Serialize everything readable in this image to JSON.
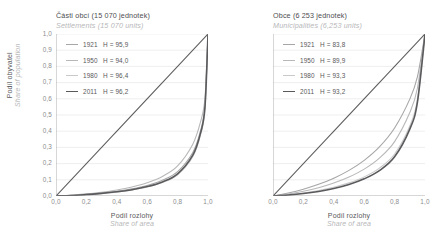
{
  "chart_data": [
    {
      "type": "line",
      "panel": "left",
      "title": "Části obcí (15 070 jednotek)",
      "subtitle": "Settlements (15 070 units)",
      "xlabel": "Podíl rozlohy",
      "xlabel_en": "Share of area",
      "ylabel": "Podíl obyvatel",
      "ylabel_en": "Share of population",
      "xlim": [
        0,
        1
      ],
      "ylim": [
        0,
        1
      ],
      "xticks": [
        "0,0",
        "0,2",
        "0,4",
        "0,6",
        "0,8",
        "1,0"
      ],
      "xtick_values": [
        0,
        0.2,
        0.4,
        0.6,
        0.8,
        1.0
      ],
      "yticks": [
        "0,0",
        "0,1",
        "0,2",
        "0,3",
        "0,4",
        "0,5",
        "0,6",
        "0,7",
        "0,8",
        "0,9",
        "1,0"
      ],
      "ytick_values": [
        0,
        0.1,
        0.2,
        0.3,
        0.4,
        0.5,
        0.6,
        0.7,
        0.8,
        0.9,
        1.0
      ],
      "grid": true,
      "legend_position": "top-left",
      "equality_line": true,
      "series": [
        {
          "name": "1921",
          "h_label": "H = 95,9",
          "h_value": 95.9,
          "color": "#a6a6a8",
          "width": 1.1,
          "x": [
            0,
            0.1,
            0.2,
            0.3,
            0.4,
            0.5,
            0.6,
            0.7,
            0.8,
            0.9,
            0.95,
            0.98,
            1.0
          ],
          "y": [
            0,
            0.004,
            0.01,
            0.018,
            0.029,
            0.044,
            0.065,
            0.097,
            0.15,
            0.268,
            0.4,
            0.56,
            1.0
          ]
        },
        {
          "name": "1950",
          "h_label": "H = 94,0",
          "h_value": 94.0,
          "color": "#b8b8ba",
          "width": 1.1,
          "x": [
            0,
            0.1,
            0.2,
            0.3,
            0.4,
            0.5,
            0.6,
            0.7,
            0.8,
            0.9,
            0.95,
            0.98,
            1.0
          ],
          "y": [
            0,
            0.005,
            0.013,
            0.023,
            0.037,
            0.056,
            0.082,
            0.121,
            0.186,
            0.32,
            0.455,
            0.605,
            1.0
          ]
        },
        {
          "name": "1980",
          "h_label": "H = 96,4",
          "h_value": 96.4,
          "color": "#c9c9cb",
          "width": 1.1,
          "x": [
            0,
            0.1,
            0.2,
            0.3,
            0.4,
            0.5,
            0.6,
            0.7,
            0.8,
            0.9,
            0.95,
            0.98,
            1.0
          ],
          "y": [
            0,
            0.003,
            0.008,
            0.015,
            0.024,
            0.037,
            0.055,
            0.083,
            0.131,
            0.243,
            0.375,
            0.54,
            1.0
          ]
        },
        {
          "name": "2011",
          "h_label": "H = 96,2",
          "h_value": 96.2,
          "color": "#5a5a5c",
          "width": 1.6,
          "x": [
            0,
            0.1,
            0.2,
            0.3,
            0.4,
            0.5,
            0.6,
            0.7,
            0.8,
            0.9,
            0.95,
            0.98,
            1.0
          ],
          "y": [
            0,
            0.003,
            0.009,
            0.016,
            0.026,
            0.039,
            0.058,
            0.087,
            0.137,
            0.252,
            0.385,
            0.548,
            1.0
          ]
        }
      ]
    },
    {
      "type": "line",
      "panel": "right",
      "title": "Obce (6 253 jednotek)",
      "subtitle": "Municipalities (6,253 units)",
      "xlabel": "Podíl rozlohy",
      "xlabel_en": "Share of area",
      "xlim": [
        0,
        1
      ],
      "ylim": [
        0,
        1
      ],
      "xticks": [
        "0,0",
        "0,2",
        "0,4",
        "0,6",
        "0,8",
        "1,0"
      ],
      "xtick_values": [
        0,
        0.2,
        0.4,
        0.6,
        0.8,
        1.0
      ],
      "ytick_values": [
        0,
        0.1,
        0.2,
        0.3,
        0.4,
        0.5,
        0.6,
        0.7,
        0.8,
        0.9,
        1.0
      ],
      "grid": true,
      "legend_position": "top-left",
      "equality_line": true,
      "series": [
        {
          "name": "1921",
          "h_label": "H = 83,8",
          "h_value": 83.8,
          "color": "#a6a6a8",
          "width": 1.1,
          "x": [
            0,
            0.1,
            0.2,
            0.3,
            0.4,
            0.5,
            0.6,
            0.7,
            0.8,
            0.9,
            0.95,
            1.0
          ],
          "y": [
            0,
            0.018,
            0.042,
            0.072,
            0.11,
            0.158,
            0.22,
            0.303,
            0.42,
            0.598,
            0.735,
            1.0
          ]
        },
        {
          "name": "1950",
          "h_label": "H = 89,9",
          "h_value": 89.9,
          "color": "#b8b8ba",
          "width": 1.1,
          "x": [
            0,
            0.1,
            0.2,
            0.3,
            0.4,
            0.5,
            0.6,
            0.7,
            0.8,
            0.9,
            0.95,
            1.0
          ],
          "y": [
            0,
            0.012,
            0.029,
            0.051,
            0.08,
            0.117,
            0.166,
            0.234,
            0.336,
            0.515,
            0.665,
            1.0
          ]
        },
        {
          "name": "1980",
          "h_label": "H = 93,3",
          "h_value": 93.3,
          "color": "#c9c9cb",
          "width": 1.1,
          "x": [
            0,
            0.1,
            0.2,
            0.3,
            0.4,
            0.5,
            0.6,
            0.7,
            0.8,
            0.9,
            0.95,
            1.0
          ],
          "y": [
            0,
            0.008,
            0.019,
            0.034,
            0.054,
            0.081,
            0.118,
            0.172,
            0.259,
            0.432,
            0.595,
            1.0
          ]
        },
        {
          "name": "2011",
          "h_label": "H = 93,2",
          "h_value": 93.2,
          "color": "#5a5a5c",
          "width": 1.6,
          "x": [
            0,
            0.1,
            0.2,
            0.3,
            0.4,
            0.5,
            0.6,
            0.7,
            0.8,
            0.9,
            0.95,
            1.0
          ],
          "y": [
            0,
            0.006,
            0.015,
            0.028,
            0.046,
            0.071,
            0.106,
            0.157,
            0.242,
            0.413,
            0.578,
            1.0
          ]
        }
      ]
    }
  ],
  "style": {
    "grid_color": "#e8e8ea",
    "axis_color": "#8c8c8e",
    "equality_color": "#5a5a5c",
    "text_color": "#59595b",
    "muted_color": "#b7b7b9"
  }
}
